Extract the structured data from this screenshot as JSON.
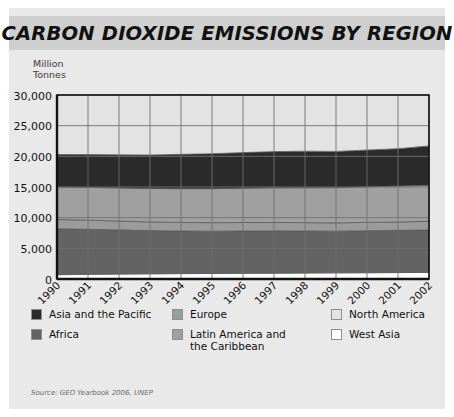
{
  "title": "CARBON DIOXIDE EMISSIONS BY REGION",
  "unit_label_line1": "Million",
  "unit_label_line2": "Tonnes",
  "source": "Source: GEO Yearbook 2006, UNEP",
  "colors": {
    "card_background": "#e9e9e9",
    "title_bar": "#cfcfcf",
    "asia_pacific": "#2b2b2b",
    "africa": "#636363",
    "europe": "#9b9b9b",
    "latin_america": "#a0a0a0",
    "north_america": "#e3e3e3",
    "west_asia": "#ffffff",
    "axis": "#111111",
    "gridline": "#6f6f6f"
  },
  "legend": {
    "columns": [
      [
        {
          "label": "Asia and the Pacific",
          "color": "#2b2b2b",
          "key": "asia-and-the-pacific"
        },
        {
          "label": "Africa",
          "color": "#636363",
          "key": "africa"
        }
      ],
      [
        {
          "label": "Europe",
          "color": "#9b9b9b",
          "key": "europe"
        },
        {
          "label": "Latin America and the Caribbean",
          "color": "#a0a0a0",
          "key": "latin-america-and-the-caribbean"
        }
      ],
      [
        {
          "label": "North America",
          "color": "#e3e3e3",
          "key": "north-america"
        },
        {
          "label": "West Asia",
          "color": "#ffffff",
          "key": "west-asia"
        }
      ]
    ]
  },
  "chart_data": {
    "type": "area",
    "stacked": true,
    "title": "CARBON DIOXIDE EMISSIONS BY REGION",
    "xlabel": "",
    "ylabel": "Million Tonnes",
    "ylim": [
      0,
      30000
    ],
    "yticks": [
      0,
      5000,
      10000,
      15000,
      20000,
      25000,
      30000
    ],
    "ytick_labels": [
      "0",
      "5,000",
      "10,000",
      "15,000",
      "20,000",
      "25,000",
      "30,000"
    ],
    "grid": true,
    "legend_position": "bottom",
    "x": [
      1990,
      1991,
      1992,
      1993,
      1994,
      1995,
      1996,
      1997,
      1998,
      1999,
      2000,
      2001,
      2002
    ],
    "categories": [
      "1990",
      "1991",
      "1992",
      "1993",
      "1994",
      "1995",
      "1996",
      "1997",
      "1998",
      "1999",
      "2000",
      "2001",
      "2002"
    ],
    "series": [
      {
        "name": "West Asia",
        "color": "#ffffff",
        "values": [
          700,
          760,
          800,
          840,
          880,
          900,
          930,
          950,
          980,
          1000,
          1020,
          1050,
          1080
        ]
      },
      {
        "name": "Africa",
        "color": "#636363",
        "values": [
          7500,
          7350,
          7200,
          7050,
          6950,
          6900,
          6900,
          6900,
          6850,
          6800,
          6850,
          6880,
          6900
        ]
      },
      {
        "name": "Europe",
        "color": "#9b9b9b",
        "values": [
          1500,
          1480,
          1450,
          1420,
          1400,
          1380,
          1380,
          1370,
          1360,
          1350,
          1360,
          1370,
          1420
        ]
      },
      {
        "name": "Latin America and the Caribbean",
        "color": "#a0a0a0",
        "values": [
          5300,
          5350,
          5400,
          5450,
          5500,
          5550,
          5600,
          5650,
          5700,
          5750,
          5800,
          5850,
          5900
        ]
      },
      {
        "name": "Asia and the Pacific",
        "color": "#2b2b2b",
        "values": [
          5300,
          5350,
          5400,
          5450,
          5600,
          5700,
          5800,
          5900,
          5950,
          5900,
          6000,
          6100,
          6400
        ]
      },
      {
        "name": "North America",
        "color": "#e3e3e3",
        "values": [
          9700,
          9710,
          9750,
          9790,
          9720,
          9570,
          9390,
          9230,
          9160,
          9200,
          8970,
          8750,
          8300
        ]
      }
    ]
  }
}
